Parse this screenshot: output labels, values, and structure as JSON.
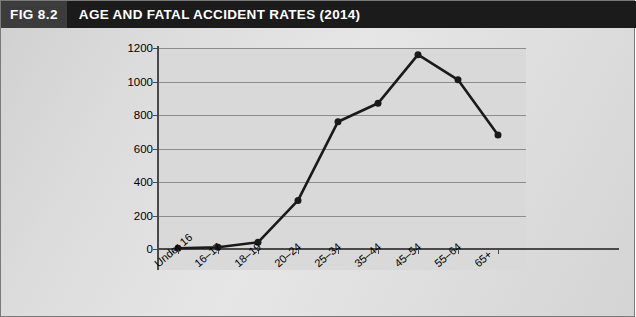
{
  "figure": {
    "number": "FIG 8.2",
    "title": "AGE AND FATAL ACCIDENT RATES (2014)",
    "title_bar_color": "#1b1b1b",
    "number_box_color": "#3c3c3c",
    "plot_bg_color": "#d9d9d9",
    "panel_bg_color": "#dcdcdc",
    "series_color": "#1a1a1a",
    "gridline_color": "#8d8d8d"
  },
  "chart_data": {
    "type": "line",
    "title": "AGE AND FATAL ACCIDENT RATES (2014)",
    "xlabel": "",
    "ylabel": "",
    "categories": [
      "Under 16",
      "16–17",
      "18–19",
      "20–24",
      "25–34",
      "35–44",
      "45–54",
      "55–64",
      "65+"
    ],
    "values": [
      5,
      10,
      40,
      290,
      760,
      870,
      1160,
      1010,
      680
    ],
    "series": [
      {
        "name": "Fatal accident rate",
        "values": [
          5,
          10,
          40,
          290,
          760,
          870,
          1160,
          1010,
          680
        ]
      }
    ],
    "ylim": [
      0,
      1200
    ],
    "ytick_labels": [
      "0",
      "200",
      "400",
      "600",
      "800",
      "1000",
      "1200"
    ],
    "ytick_values": [
      0,
      200,
      400,
      600,
      800,
      1000,
      1200
    ],
    "grid": "horizontal",
    "legend": "none",
    "markers": "filled-circle",
    "xlabel_rotation": "-40"
  }
}
